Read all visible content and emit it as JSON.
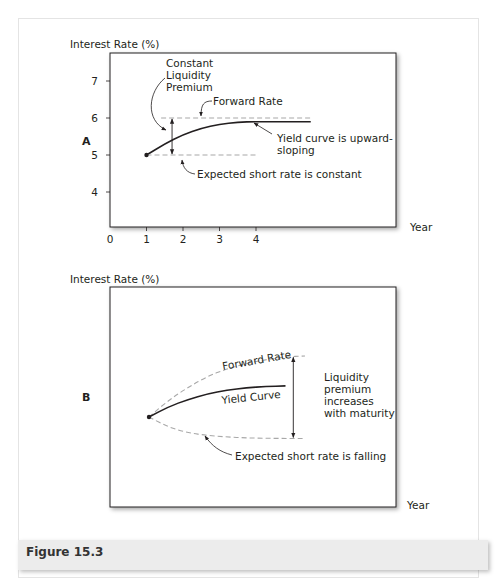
{
  "figure": {
    "caption": "Figure 15.3"
  },
  "chart_data": [
    {
      "type": "line",
      "panel_label": "A",
      "ylabel": "Interest Rate (%)",
      "xlabel": "Year",
      "xlim": [
        0,
        6.8
      ],
      "ylim": [
        3.1,
        7.7
      ],
      "xticks": [
        0,
        1,
        2,
        3,
        4
      ],
      "xtick_labels": [
        "0",
        "1",
        "2",
        "3",
        "4"
      ],
      "yticks": [
        4,
        5,
        6,
        7
      ],
      "ytick_labels": [
        "4",
        "5",
        "6",
        "7"
      ],
      "series": [
        {
          "name": "Yield Curve",
          "style": "solid",
          "x": [
            1,
            1.5,
            2,
            2.5,
            3,
            3.5,
            4,
            4.5,
            5,
            5.5
          ],
          "y": [
            5.0,
            5.3,
            5.55,
            5.72,
            5.83,
            5.89,
            5.9,
            5.9,
            5.9,
            5.9
          ]
        },
        {
          "name": "Forward Rate",
          "style": "dashed",
          "x": [
            1.4,
            5.5
          ],
          "y": [
            6.0,
            6.0
          ]
        },
        {
          "name": "Expected Short Rate",
          "style": "dashed",
          "x": [
            1,
            4
          ],
          "y": [
            5.0,
            5.0
          ]
        }
      ],
      "annotations": [
        {
          "text": [
            "Constant",
            "Liquidity",
            "Premium"
          ]
        },
        {
          "text": [
            "Forward Rate"
          ]
        },
        {
          "text": [
            "Yield curve is upward-",
            "sloping"
          ]
        },
        {
          "text": [
            "Expected short rate is constant"
          ]
        }
      ],
      "premium_arrow": {
        "x": 1.7,
        "from": 5.0,
        "to": 6.0
      }
    },
    {
      "type": "line",
      "panel_label": "B",
      "ylabel": "Interest Rate (%)",
      "xlabel": "Year",
      "xlim": [
        0,
        6.8
      ],
      "ylim": [
        0,
        10
      ],
      "series": [
        {
          "name": "Forward Rate",
          "style": "dashed",
          "x": [
            1,
            1.5,
            2,
            2.5,
            3,
            3.5,
            4,
            4.5,
            5
          ],
          "y": [
            5.0,
            5.9,
            6.6,
            7.2,
            7.6,
            7.9,
            8.1,
            8.25,
            8.3
          ]
        },
        {
          "name": "Yield Curve",
          "style": "solid",
          "x": [
            1,
            1.5,
            2,
            2.5,
            3,
            3.5,
            4,
            4.5
          ],
          "y": [
            5.0,
            5.55,
            5.95,
            6.25,
            6.45,
            6.58,
            6.65,
            6.68
          ]
        },
        {
          "name": "Expected Short Rate",
          "style": "dashed",
          "x": [
            1,
            1.5,
            2,
            2.5,
            3,
            3.5,
            4,
            4.5,
            5
          ],
          "y": [
            5.0,
            4.45,
            4.15,
            4.0,
            3.92,
            3.87,
            3.85,
            3.84,
            3.84
          ]
        }
      ],
      "annotations": [
        {
          "text": [
            "Forward Rate"
          ]
        },
        {
          "text": [
            "Yield Curve"
          ]
        },
        {
          "text": [
            "Liquidity",
            "premium",
            "increases",
            "with maturity"
          ]
        },
        {
          "text": [
            "Expected short rate is falling"
          ]
        }
      ],
      "premium_arrow": {
        "x": 4.7,
        "from": 3.84,
        "to": 8.28
      }
    }
  ]
}
